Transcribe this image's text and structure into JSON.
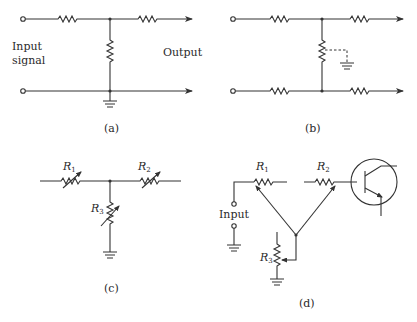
{
  "figure": {
    "panels": [
      {
        "id": "a",
        "caption": "(a)",
        "labels": {
          "input_line1": "Input",
          "input_line2": "signal",
          "output": "Output"
        },
        "description": "T-network: series resistor, shunt resistor to ground junction, series resistor; bottom line grounded"
      },
      {
        "id": "b",
        "caption": "(b)",
        "description": "Balanced H-network: series resistors on top and bottom lines, shunt resistor with dashed center-tap to ground"
      },
      {
        "id": "c",
        "caption": "(c)",
        "labels": {
          "r1": "R",
          "r1_sub": "1",
          "r2": "R",
          "r2_sub": "2",
          "r3": "R",
          "r3_sub": "3"
        },
        "description": "T-attenuator with variable resistors R1, R2 series and R3 shunt to ground"
      },
      {
        "id": "d",
        "caption": "(d)",
        "labels": {
          "input": "Input",
          "r1": "R",
          "r1_sub": "1",
          "r2": "R",
          "r2_sub": "2",
          "r3": "R",
          "r3_sub": "3"
        },
        "description": "Ganged potentiometers R1, R2 wipers joined and tied to R3 wiper feeding transistor base"
      }
    ]
  }
}
